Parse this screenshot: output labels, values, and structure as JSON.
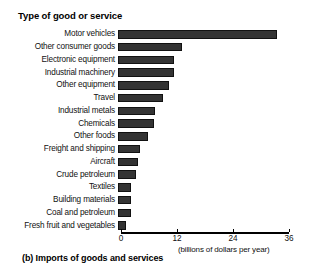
{
  "figure": {
    "caption": "(b) Imports of goods and services",
    "axis_title": "Type of good or service",
    "x_units": "(billions of dollars per year)",
    "bar_color": "#333333",
    "background_color": "#ffffff"
  },
  "chart_data": {
    "type": "bar",
    "orientation": "horizontal",
    "title": "(b) Imports of goods and services",
    "xlabel": "(billions of dollars per year)",
    "ylabel": "Type of good or service",
    "xlim": [
      0,
      36
    ],
    "xticks": [
      0,
      12,
      24,
      36
    ],
    "xtick_labels": [
      "0",
      "12",
      "24",
      "36"
    ],
    "grid": false,
    "legend": false,
    "categories": [
      "Motor vehicles",
      "Other consumer goods",
      "Electronic equipment",
      "Industrial machinery",
      "Other equipment",
      "Travel",
      "Industrial metals",
      "Chemicals",
      "Other foods",
      "Freight and shipping",
      "Aircraft",
      "Crude petroleum",
      "Textiles",
      "Building materials",
      "Coal and petroleum",
      "Fresh fruit and vegetables"
    ],
    "values": [
      34,
      13.8,
      12,
      12,
      11,
      9.7,
      8,
      7.8,
      6.5,
      4.7,
      4.3,
      3.9,
      2.8,
      2.8,
      2.8,
      1.7
    ]
  }
}
